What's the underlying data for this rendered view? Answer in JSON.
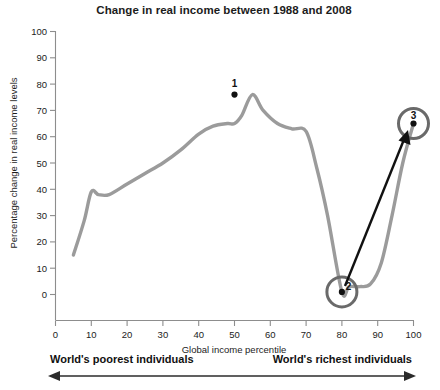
{
  "chart_data": {
    "type": "line",
    "title": "Change in real income between 1988 and 2008",
    "xlabel": "Global income percentile",
    "ylabel": "Percentage change in real income levels",
    "xlim": [
      0,
      100
    ],
    "ylim": [
      0,
      100
    ],
    "grid": false,
    "legend": "none",
    "line_color": "#9b9b9b",
    "x_ticks": [
      0,
      10,
      20,
      30,
      40,
      50,
      60,
      70,
      80,
      90,
      100
    ],
    "y_ticks": [
      0,
      10,
      20,
      30,
      40,
      50,
      60,
      70,
      80,
      90,
      100
    ],
    "x": [
      5,
      8,
      10,
      12,
      15,
      20,
      25,
      30,
      35,
      40,
      44,
      48,
      50,
      52,
      55,
      58,
      62,
      66,
      70,
      73,
      76,
      80,
      82,
      85,
      88,
      91,
      94,
      97,
      100
    ],
    "values": [
      15,
      28,
      39,
      38,
      38,
      42,
      46,
      50,
      55,
      61,
      64,
      65,
      65,
      68,
      76,
      70,
      65,
      63,
      62,
      48,
      30,
      1,
      3,
      3,
      4,
      12,
      30,
      50,
      65
    ],
    "annotations": [
      {
        "id": "1",
        "label": "1",
        "x": 55,
        "y": 76,
        "style": "dot"
      },
      {
        "id": "2",
        "label": "2",
        "x": 80,
        "y": 1,
        "style": "circled"
      },
      {
        "id": "3",
        "label": "3",
        "x": 100,
        "y": 65,
        "style": "circled"
      }
    ],
    "arrow": {
      "from_point": "2",
      "to_point": "3"
    }
  },
  "axis_range_note": {
    "left_label": "World's poorest individuals",
    "right_label": "World's richest individuals"
  },
  "icons": {
    "left_arrow": "arrow-left-icon",
    "right_arrow": "arrow-right-icon",
    "callout_arrow": "arrow-up-right-icon"
  }
}
